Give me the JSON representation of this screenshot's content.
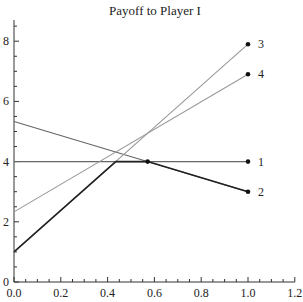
{
  "chart_data": {
    "type": "line",
    "title": "Payoff to Player I",
    "xlabel": "",
    "ylabel": "",
    "xlim": [
      0,
      1.2
    ],
    "ylim": [
      0,
      8.7
    ],
    "xticks": [
      0.0,
      0.2,
      0.4,
      0.6,
      0.8,
      1.0,
      1.2
    ],
    "xtick_labels": [
      "0.0",
      "0.2",
      "0.4",
      "0.6",
      "0.8",
      "1.0",
      "1.2"
    ],
    "xminor_step": 0.05,
    "yticks": [
      0,
      2,
      4,
      6,
      8
    ],
    "ytick_labels": [
      "0",
      "2",
      "4",
      "6",
      "8"
    ],
    "yminor_step": 0.5,
    "grid": false,
    "series": [
      {
        "name": "1",
        "x": [
          0,
          1
        ],
        "y": [
          4,
          4
        ],
        "color": "#666666"
      },
      {
        "name": "2",
        "x": [
          0,
          1
        ],
        "y": [
          5.33,
          3
        ],
        "color": "#666666"
      },
      {
        "name": "3",
        "x": [
          0,
          1
        ],
        "y": [
          1,
          7.9
        ],
        "color": "#999999"
      },
      {
        "name": "4",
        "x": [
          0,
          1
        ],
        "y": [
          2.33,
          6.9
        ],
        "color": "#999999"
      }
    ],
    "lower_envelope": {
      "x": [
        0,
        0.435,
        0.571,
        1
      ],
      "y": [
        1,
        4,
        4,
        3
      ],
      "color": "#222222"
    },
    "markers": [
      {
        "x": 1,
        "y": 4
      },
      {
        "x": 1,
        "y": 3
      },
      {
        "x": 1,
        "y": 7.9
      },
      {
        "x": 1,
        "y": 6.9
      },
      {
        "x": 0.571,
        "y": 4
      }
    ]
  }
}
